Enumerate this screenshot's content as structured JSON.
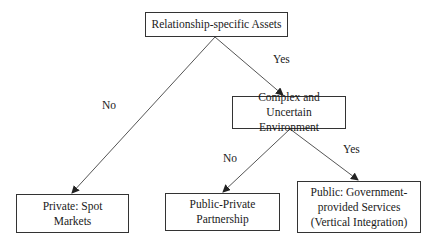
{
  "diagram": {
    "type": "decision-tree",
    "nodes": {
      "root": {
        "label": "Relationship-specific Assets"
      },
      "complex": {
        "label": "Complex and Uncertain Environment"
      },
      "private": {
        "label": "Private: Spot Markets"
      },
      "ppp": {
        "label": "Public-Private Partnership"
      },
      "public": {
        "label": "Public: Government-provided Services (Vertical Integration)"
      }
    },
    "edges": [
      {
        "from": "root",
        "to": "private",
        "label": "No"
      },
      {
        "from": "root",
        "to": "complex",
        "label": "Yes"
      },
      {
        "from": "complex",
        "to": "ppp",
        "label": "No"
      },
      {
        "from": "complex",
        "to": "public",
        "label": "Yes"
      }
    ],
    "edge_labels": {
      "root_no": "No",
      "root_yes": "Yes",
      "complex_no": "No",
      "complex_yes": "Yes"
    },
    "colors": {
      "line": "#333333",
      "background": "#ffffff",
      "text": "#1a1a1a"
    }
  }
}
